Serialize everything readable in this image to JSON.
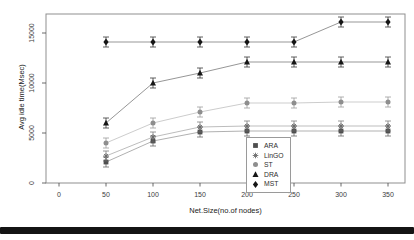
{
  "chart_data": {
    "type": "line",
    "title": "",
    "xlabel": "Net.Size(no.of nodes)",
    "ylabel": "Avg idle time(Msec)",
    "x": [
      50,
      100,
      150,
      200,
      250,
      300,
      350
    ],
    "xticks": [
      0,
      50,
      100,
      150,
      200,
      250,
      300,
      350
    ],
    "yticks": [
      0,
      5000,
      10000,
      15000
    ],
    "xlim": [
      -10,
      370
    ],
    "ylim": [
      0,
      16900
    ],
    "grid": false,
    "legend_position": "inside-bottom-center",
    "error_bar": 500,
    "series": [
      {
        "name": "ARA",
        "marker": "square",
        "color": "#4f4f4f",
        "values": [
          2100,
          4200,
          5100,
          5200,
          5200,
          5200,
          5200
        ]
      },
      {
        "name": "LinGO",
        "marker": "asterisk",
        "color": "#6b6b6b",
        "values": [
          2700,
          4600,
          5600,
          5700,
          5700,
          5700,
          5700
        ]
      },
      {
        "name": "ST",
        "marker": "circle",
        "color": "#8e8e8e",
        "values": [
          4000,
          6000,
          7100,
          8000,
          8000,
          8100,
          8100
        ]
      },
      {
        "name": "DRA",
        "marker": "triangle",
        "color": "#161616",
        "values": [
          6000,
          10000,
          11000,
          12100,
          12100,
          12100,
          12100
        ]
      },
      {
        "name": "MST",
        "marker": "diamond",
        "color": "#161616",
        "values": [
          14100,
          14100,
          14100,
          14100,
          14100,
          16100,
          16100
        ]
      }
    ]
  },
  "decor": {
    "frame_color": "#8f8f8f",
    "tick_color": "#444444",
    "bottom_bar_color": "#141414"
  }
}
